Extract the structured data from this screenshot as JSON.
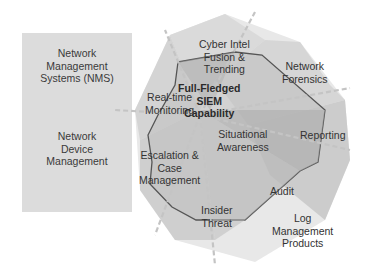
{
  "left_panel": {
    "top_box": {
      "label_lines": [
        "Network",
        "Management",
        "Systems (NMS)"
      ]
    },
    "bottom_box": {
      "label_lines": [
        "Network",
        "Device",
        "Management"
      ]
    }
  },
  "radar": {
    "center_title_lines": [
      "Full-Fledged",
      "SIEM",
      "Capability"
    ],
    "axes": [
      {
        "id": "cyber-intel",
        "lines": [
          "Cyber Intel",
          "Fusion &",
          "Trending"
        ]
      },
      {
        "id": "network-forensics",
        "lines": [
          "Network",
          "Forensics"
        ]
      },
      {
        "id": "reporting",
        "lines": [
          "Reporting"
        ]
      },
      {
        "id": "audit",
        "lines": [
          "Audit"
        ]
      },
      {
        "id": "insider-threat",
        "lines": [
          "Insider",
          "Threat"
        ]
      },
      {
        "id": "escalation",
        "lines": [
          "Escalation &",
          "Case",
          "Management"
        ]
      },
      {
        "id": "real-time-monitoring",
        "lines": [
          "Real-time",
          "Monitoring"
        ]
      },
      {
        "id": "situational-awareness",
        "lines": [
          "Situational",
          "Awareness"
        ]
      }
    ],
    "outer_label": {
      "id": "log-management",
      "lines": [
        "Log",
        "Management",
        "Products"
      ]
    }
  },
  "colors": {
    "outer_fill": "#e6e6e6",
    "mid_fill": "#cfcfcf",
    "inner_fill": "#b9b9b9",
    "outline": "#555555",
    "box_fill": "#dcdcdc"
  }
}
